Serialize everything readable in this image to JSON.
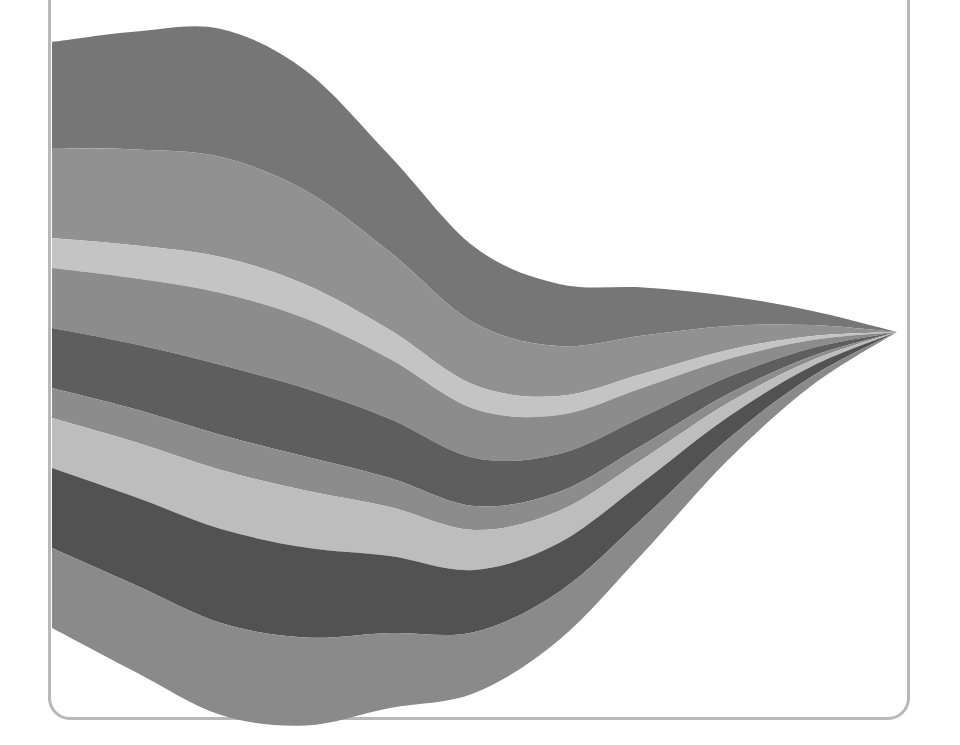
{
  "figure": {
    "title": "",
    "background_color": "#ffffff",
    "frame": {
      "border_color": "#b8b8b8",
      "border_width": 3,
      "corner_radius": 22,
      "left": 48,
      "right": 910,
      "bottom": 720
    }
  },
  "chart_data": {
    "type": "area",
    "subtype": "streamgraph",
    "title": "",
    "subtitle": "",
    "xlabel": "",
    "ylabel": "",
    "grid": false,
    "axes_visible": false,
    "tick_labels_visible": false,
    "legend": {
      "visible": false,
      "position": "none",
      "entries": []
    },
    "annotations": [],
    "offset": "wiggle",
    "order": "inside-out",
    "interpolation": "basis",
    "xlim": [
      0,
      10
    ],
    "ylim": [
      0,
      1
    ],
    "x": [
      0,
      1,
      2,
      3,
      4,
      5,
      6,
      7,
      8,
      9,
      10
    ],
    "series": [
      {
        "name": "series-1",
        "color": "#767676",
        "values": [
          106,
          118,
          128,
          120,
          96,
          76,
          62,
          48,
          30,
          14,
          0
        ]
      },
      {
        "name": "series-2",
        "color": "#919191",
        "values": [
          90,
          96,
          100,
          94,
          78,
          62,
          50,
          38,
          24,
          11,
          0
        ]
      },
      {
        "name": "series-3",
        "color": "#c4c4c4",
        "values": [
          30,
          33,
          36,
          34,
          29,
          24,
          19,
          14,
          9,
          4,
          0
        ]
      },
      {
        "name": "series-4",
        "color": "#8c8c8c",
        "values": [
          60,
          66,
          72,
          70,
          60,
          49,
          39,
          29,
          18,
          8,
          0
        ]
      },
      {
        "name": "series-5",
        "color": "#5e5e5e",
        "values": [
          60,
          65,
          70,
          68,
          59,
          48,
          38,
          28,
          17,
          8,
          0
        ]
      },
      {
        "name": "series-6",
        "color": "#8c8c8c",
        "values": [
          30,
          33,
          35,
          34,
          29,
          24,
          19,
          14,
          9,
          4,
          0
        ]
      },
      {
        "name": "series-7",
        "color": "#bdbdbd",
        "values": [
          50,
          55,
          59,
          57,
          49,
          40,
          32,
          23,
          14,
          6,
          0
        ]
      },
      {
        "name": "series-8",
        "color": "#525252",
        "values": [
          80,
          88,
          94,
          90,
          77,
          62,
          49,
          36,
          22,
          10,
          0
        ]
      },
      {
        "name": "series-9",
        "color": "#8a8a8a",
        "values": [
          80,
          87,
          92,
          88,
          75,
          61,
          48,
          35,
          21,
          9,
          0
        ]
      }
    ],
    "palette": [
      "#767676",
      "#919191",
      "#c4c4c4",
      "#8c8c8c",
      "#5e5e5e",
      "#8c8c8c",
      "#bdbdbd",
      "#525252",
      "#8a8a8a"
    ],
    "band_boundaries_left_edge_px": [
      42,
      148,
      238,
      268,
      328,
      388,
      418,
      468,
      548,
      628
    ],
    "converge_point_px": {
      "x": 897,
      "y": 332
    }
  }
}
